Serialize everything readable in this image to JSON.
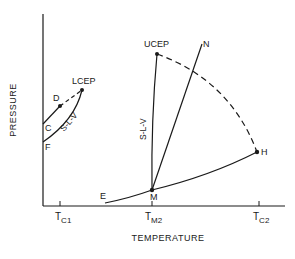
{
  "diagram": {
    "type": "phase-diagram",
    "axes": {
      "xlabel": "TEMPERATURE",
      "ylabel": "PRESSURE",
      "x_ticks": [
        {
          "main": "T",
          "sub": "C1"
        },
        {
          "main": "T",
          "sub": "M2"
        },
        {
          "main": "T",
          "sub": "C2"
        }
      ]
    },
    "points": {
      "lcep": "LCEP",
      "ucep": "UCEP",
      "d": "D",
      "c": "C",
      "f": "F",
      "e": "E",
      "m": "M",
      "h": "H",
      "n": "N"
    },
    "curve_labels": {
      "slv_left": "S-L-V",
      "slv_right": "S-L-V"
    },
    "colors": {
      "line": "#1a1a1a",
      "background": "#ffffff"
    }
  }
}
